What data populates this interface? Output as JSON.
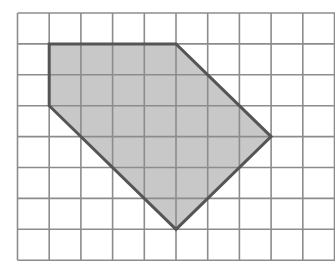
{
  "diagram": {
    "type": "grid-polygon",
    "grid": {
      "origin_px": [
        17.5,
        13
      ],
      "cell_px": [
        31.7,
        30.9
      ],
      "columns": 10,
      "rows": 8,
      "open_right_edge": true,
      "line_color": "#8c8c8c",
      "line_width": 1.6
    },
    "polygon": {
      "vertices": [
        [
          1,
          1
        ],
        [
          5,
          1
        ],
        [
          8,
          4
        ],
        [
          5,
          7
        ],
        [
          1,
          3
        ]
      ],
      "fill_color": "#c8c8c8",
      "stroke_color": "#555555",
      "stroke_width": 3
    },
    "colors": {
      "background": "#ffffff"
    }
  }
}
